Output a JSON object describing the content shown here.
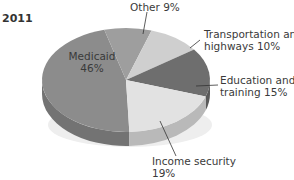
{
  "chart_data": {
    "type": "pie",
    "title": "2011",
    "style": "3d-tilted",
    "slices": [
      {
        "label": "Medicaid",
        "value": 46,
        "color": "#8c8c8c"
      },
      {
        "label": "Other",
        "value": 9,
        "color": "#9e9e9e"
      },
      {
        "label": "Transportation and highways",
        "value": 10,
        "color": "#cfcfcf"
      },
      {
        "label": "Education and training",
        "value": 15,
        "color": "#6e6e6e"
      },
      {
        "label": "Income security",
        "value": 19,
        "color": "#e2e2e2"
      }
    ],
    "units": "%"
  },
  "labels": {
    "year": "2011",
    "medicaid_name": "Medicaid",
    "medicaid_value": "46%",
    "other": "Other 9%",
    "transport_line1": "Transportation and",
    "transport_line2": "highways 10%",
    "education_line1": "Education and",
    "education_line2": "training 15%",
    "income_line1": "Income security",
    "income_line2": "19%"
  }
}
